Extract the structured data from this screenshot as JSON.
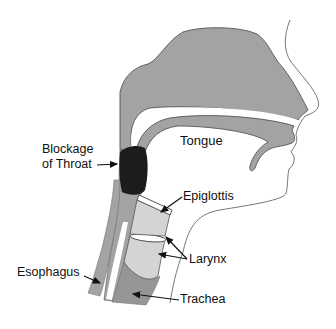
{
  "diagram": {
    "labels": {
      "tongue": "Tongue",
      "blockage_line1": "Blockage",
      "blockage_line2": "of Throat",
      "epiglottis": "Epiglottis",
      "larynx": "Larynx",
      "esophagus": "Esophagus",
      "trachea": "Trachea"
    },
    "colors": {
      "background": "#ffffff",
      "tissue": "#a3a3a3",
      "tissue_dark": "#8e8e8e",
      "larynx": "#d4d4d4",
      "blockage": "#1c1c1c",
      "outline": "#555555",
      "text": "#111111"
    }
  }
}
